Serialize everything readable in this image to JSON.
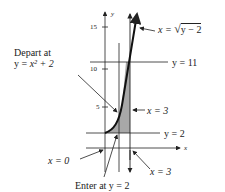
{
  "diagram": {
    "axes": {
      "x_label": "x",
      "y_label": "y",
      "y_ticks": [
        "15",
        "10",
        "5"
      ]
    },
    "labels": {
      "depart_line1": "Depart at",
      "depart_line2_prefix": "y = ",
      "depart_line2_expr": "x² + 2",
      "curve_eq_prefix": "x = ",
      "curve_eq_radicand": "y − 2",
      "y11": "y = 11",
      "y2": "y = 2",
      "x3_upper": "x = 3",
      "x3_lower": "x = 3",
      "x0": "x = 0",
      "enter": "Enter at y = 2"
    },
    "colors": {
      "line": "#222222",
      "shade": "#a8a8a8"
    }
  }
}
